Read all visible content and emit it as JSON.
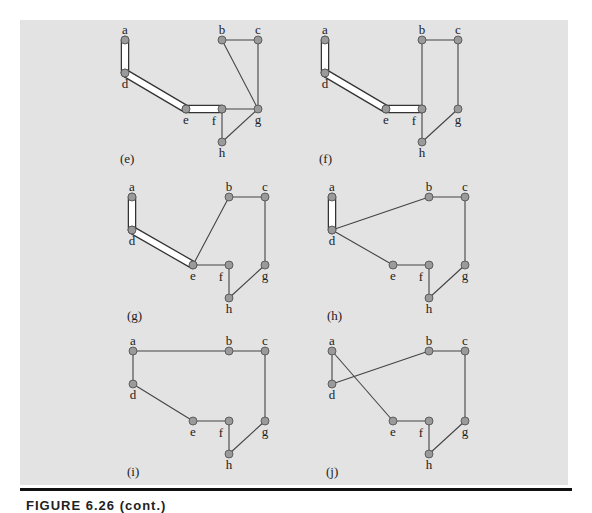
{
  "figure": {
    "background_color": "#e3e3e3",
    "node_fill": "#9a9a9a",
    "node_stroke": "#555555",
    "edge_color": "#444444",
    "highlight_fill": "#ffffff",
    "caption": "FIGURE 6.26 (cont.)"
  },
  "panels": [
    {
      "label": "(e)",
      "label_pos": [
        120,
        163
      ],
      "nodes": {
        "a": [
          125,
          40
        ],
        "b": [
          222,
          40
        ],
        "c": [
          258,
          40
        ],
        "d": [
          125,
          73
        ],
        "e": [
          186,
          109
        ],
        "f": [
          222,
          109
        ],
        "g": [
          258,
          109
        ],
        "h": [
          222,
          142
        ]
      },
      "thick_edges": [
        [
          "a",
          "d"
        ],
        [
          "d",
          "e"
        ],
        [
          "e",
          "f"
        ]
      ],
      "edges": [
        [
          "b",
          "c"
        ],
        [
          "c",
          "g"
        ],
        [
          "b",
          "g"
        ],
        [
          "f",
          "g"
        ],
        [
          "f",
          "h"
        ],
        [
          "h",
          "g"
        ]
      ]
    },
    {
      "label": "(f)",
      "label_pos": [
        319,
        163
      ],
      "nodes": {
        "a": [
          325,
          40
        ],
        "b": [
          422,
          40
        ],
        "c": [
          458,
          40
        ],
        "d": [
          325,
          73
        ],
        "e": [
          386,
          109
        ],
        "f": [
          422,
          109
        ],
        "g": [
          458,
          109
        ],
        "h": [
          422,
          142
        ]
      },
      "thick_edges": [
        [
          "a",
          "d"
        ],
        [
          "d",
          "e"
        ],
        [
          "e",
          "f"
        ]
      ],
      "edges": [
        [
          "b",
          "c"
        ],
        [
          "b",
          "f"
        ],
        [
          "f",
          "h"
        ],
        [
          "c",
          "g"
        ],
        [
          "g",
          "h"
        ]
      ]
    },
    {
      "label": "(g)",
      "label_pos": [
        127,
        320
      ],
      "nodes": {
        "a": [
          132,
          197
        ],
        "b": [
          229,
          197
        ],
        "c": [
          265,
          197
        ],
        "d": [
          132,
          230
        ],
        "e": [
          193,
          265
        ],
        "f": [
          229,
          265
        ],
        "g": [
          265,
          265
        ],
        "h": [
          229,
          298
        ]
      },
      "thick_edges": [
        [
          "a",
          "d"
        ],
        [
          "d",
          "e"
        ]
      ],
      "edges": [
        [
          "e",
          "b"
        ],
        [
          "b",
          "c"
        ],
        [
          "c",
          "g"
        ],
        [
          "g",
          "h"
        ],
        [
          "h",
          "f"
        ],
        [
          "f",
          "e"
        ]
      ]
    },
    {
      "label": "(h)",
      "label_pos": [
        327,
        320
      ],
      "nodes": {
        "a": [
          332,
          197
        ],
        "b": [
          429,
          197
        ],
        "c": [
          465,
          197
        ],
        "d": [
          332,
          230
        ],
        "e": [
          393,
          265
        ],
        "f": [
          429,
          265
        ],
        "g": [
          465,
          265
        ],
        "h": [
          429,
          298
        ]
      },
      "thick_edges": [
        [
          "a",
          "d"
        ]
      ],
      "edges": [
        [
          "d",
          "b"
        ],
        [
          "b",
          "c"
        ],
        [
          "c",
          "g"
        ],
        [
          "g",
          "h"
        ],
        [
          "h",
          "f"
        ],
        [
          "f",
          "e"
        ],
        [
          "e",
          "d"
        ]
      ]
    },
    {
      "label": "(i)",
      "label_pos": [
        127,
        476
      ],
      "nodes": {
        "a": [
          133,
          351
        ],
        "b": [
          229,
          351
        ],
        "c": [
          265,
          351
        ],
        "d": [
          133,
          384
        ],
        "e": [
          193,
          421
        ],
        "f": [
          229,
          421
        ],
        "g": [
          265,
          421
        ],
        "h": [
          229,
          454
        ]
      },
      "thick_edges": [],
      "edges": [
        [
          "a",
          "b"
        ],
        [
          "b",
          "c"
        ],
        [
          "c",
          "g"
        ],
        [
          "g",
          "h"
        ],
        [
          "h",
          "f"
        ],
        [
          "f",
          "e"
        ],
        [
          "e",
          "d"
        ],
        [
          "d",
          "a"
        ]
      ]
    },
    {
      "label": "(j)",
      "label_pos": [
        326,
        476
      ],
      "nodes": {
        "a": [
          332,
          351
        ],
        "b": [
          429,
          351
        ],
        "c": [
          465,
          351
        ],
        "d": [
          332,
          384
        ],
        "e": [
          393,
          421
        ],
        "f": [
          429,
          421
        ],
        "g": [
          465,
          421
        ],
        "h": [
          429,
          454
        ]
      },
      "thick_edges": [],
      "edges": [
        [
          "a",
          "d"
        ],
        [
          "d",
          "b"
        ],
        [
          "b",
          "c"
        ],
        [
          "c",
          "g"
        ],
        [
          "g",
          "h"
        ],
        [
          "h",
          "f"
        ],
        [
          "f",
          "e"
        ],
        [
          "e",
          "a"
        ]
      ]
    }
  ]
}
